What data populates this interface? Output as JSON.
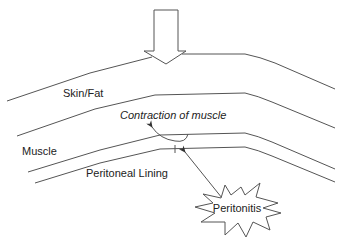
{
  "diagram": {
    "labels": {
      "skin_fat": "Skin/Fat",
      "contraction": "Contraction of muscle",
      "muscle": "Muscle",
      "peritoneal_lining": "Peritoneal Lining",
      "peritonitis": "Peritonitis"
    },
    "elements": [
      {
        "name": "pressure-arrow",
        "description": "Large hollow downward arrow pressing on skin surface"
      },
      {
        "name": "skin-surface-line"
      },
      {
        "name": "skin-fat-bottom-line"
      },
      {
        "name": "muscle-bottom-line"
      },
      {
        "name": "peritoneal-lining-line"
      },
      {
        "name": "contraction-arrow",
        "description": "Curved arrow from muscle layer toward contraction label"
      },
      {
        "name": "peritonitis-arrow",
        "description": "Arrow from peritonitis burst pointing to peritoneal lining"
      },
      {
        "name": "peritonitis-burst",
        "description": "Starburst shape containing Peritonitis label"
      }
    ],
    "colors": {
      "stroke": "#555555",
      "text": "#222222",
      "background": "#ffffff"
    }
  }
}
